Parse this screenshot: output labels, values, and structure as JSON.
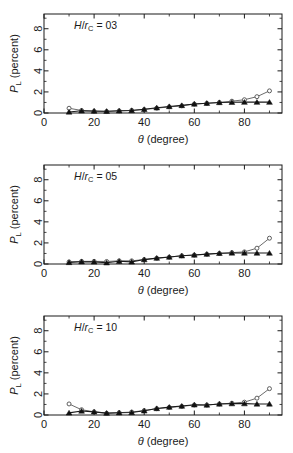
{
  "figure": {
    "panel_count": 3,
    "background": "#ffffff",
    "foreground": "#1a1a1a"
  },
  "axes": {
    "xlabel_symbol": "θ",
    "xlabel_unit": " (degree)",
    "ylabel_symbol": "P",
    "ylabel_sub": "L",
    "ylabel_unit": " (percent)",
    "xticks": [
      0,
      20,
      40,
      60,
      80
    ],
    "xticklabels": [
      "0",
      "20",
      "40",
      "60",
      "80"
    ],
    "yticks": [
      0,
      2,
      4,
      6,
      8
    ],
    "yticklabels": [
      "0",
      "2",
      "4",
      "6",
      "8"
    ],
    "xlim": [
      0,
      95
    ],
    "ylim": [
      0,
      9.4
    ],
    "x_minor_step": 10,
    "y_minor_step": 1,
    "grid": false
  },
  "series_style": {
    "circle_name": "open-circle",
    "circle_color": "#5a5a5a",
    "triangle_name": "filled-triangle",
    "triangle_color": "#111111"
  },
  "chart_data": [
    {
      "type": "line",
      "panel_index": 0,
      "title": "",
      "annotation": "H/r_C = 03",
      "annotation_num": "03",
      "xlabel": "θ (degree)",
      "ylabel": "P_L (percent)",
      "xlim": [
        0,
        95
      ],
      "ylim": [
        0,
        9.4
      ],
      "x": [
        10,
        15,
        20,
        25,
        30,
        35,
        40,
        45,
        50,
        55,
        60,
        65,
        70,
        75,
        80,
        85,
        90
      ],
      "series": [
        {
          "name": "open-circle",
          "marker": "circle-open",
          "values": [
            0.45,
            0.24,
            0.16,
            0.14,
            0.2,
            0.25,
            0.33,
            0.46,
            0.58,
            0.68,
            0.85,
            0.92,
            1.0,
            1.12,
            1.26,
            1.55,
            2.1
          ]
        },
        {
          "name": "filled-triangle",
          "marker": "triangle-filled",
          "values": [
            0.1,
            0.21,
            0.19,
            0.17,
            0.21,
            0.24,
            0.35,
            0.5,
            0.62,
            0.72,
            0.86,
            0.93,
            1.0,
            1.02,
            1.03,
            1.03,
            1.03
          ]
        }
      ]
    },
    {
      "type": "line",
      "panel_index": 1,
      "title": "",
      "annotation": "H/r_C = 05",
      "annotation_num": "05",
      "xlabel": "θ (degree)",
      "ylabel": "P_L (percent)",
      "xlim": [
        0,
        95
      ],
      "ylim": [
        0,
        9.4
      ],
      "x": [
        10,
        15,
        20,
        25,
        30,
        35,
        40,
        45,
        50,
        55,
        60,
        65,
        70,
        75,
        80,
        85,
        90
      ],
      "series": [
        {
          "name": "open-circle",
          "marker": "circle-open",
          "values": [
            0.2,
            0.25,
            0.25,
            0.24,
            0.3,
            0.3,
            0.42,
            0.55,
            0.65,
            0.78,
            0.85,
            0.93,
            1.0,
            1.08,
            1.15,
            1.5,
            2.45
          ]
        },
        {
          "name": "filled-triangle",
          "marker": "triangle-filled",
          "values": [
            0.15,
            0.22,
            0.2,
            0.12,
            0.26,
            0.2,
            0.42,
            0.56,
            0.66,
            0.78,
            0.86,
            0.94,
            1.02,
            1.05,
            1.05,
            1.04,
            1.04
          ]
        }
      ]
    },
    {
      "type": "line",
      "panel_index": 2,
      "title": "",
      "annotation": "H/r_C = 10",
      "annotation_num": "10",
      "xlabel": "θ (degree)",
      "ylabel": "P_L (percent)",
      "xlim": [
        0,
        95
      ],
      "ylim": [
        0,
        9.4
      ],
      "x": [
        10,
        15,
        20,
        25,
        30,
        35,
        40,
        45,
        50,
        55,
        60,
        65,
        70,
        75,
        80,
        85,
        90
      ],
      "series": [
        {
          "name": "open-circle",
          "marker": "circle-open",
          "values": [
            1.05,
            0.5,
            0.3,
            0.16,
            0.22,
            0.28,
            0.42,
            0.6,
            0.72,
            0.82,
            0.95,
            0.95,
            1.05,
            1.12,
            1.22,
            1.6,
            2.5
          ]
        },
        {
          "name": "filled-triangle",
          "marker": "triangle-filled",
          "values": [
            0.2,
            0.38,
            0.3,
            0.18,
            0.22,
            0.24,
            0.4,
            0.62,
            0.75,
            0.85,
            0.97,
            0.95,
            1.05,
            1.08,
            1.08,
            1.05,
            1.05
          ]
        }
      ]
    }
  ]
}
